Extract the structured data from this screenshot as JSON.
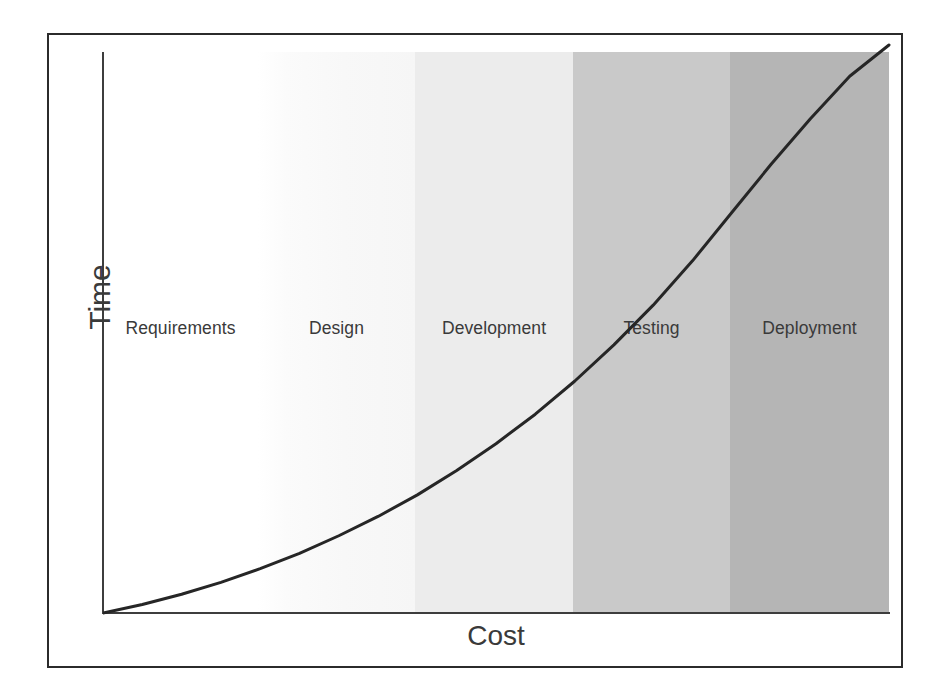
{
  "chart_data": {
    "type": "area",
    "title": "",
    "subtitle": "",
    "xlabel": "Cost",
    "ylabel": "Time",
    "grid": false,
    "legend": "none",
    "xlim": [
      0,
      5
    ],
    "ylim": [
      0,
      1
    ],
    "axis_ticks": {
      "x": [],
      "y": []
    },
    "categories": [
      "Requirements",
      "Design",
      "Development",
      "Testing",
      "Deployment"
    ],
    "bands": [
      {
        "label": "Requirements",
        "x_start": 0,
        "x_end": 1,
        "fill": "#ffffff"
      },
      {
        "label": "Design",
        "x_start": 1,
        "x_end": 2,
        "fill": "#fafafa"
      },
      {
        "label": "Development",
        "x_start": 2,
        "x_end": 3,
        "fill": "#ececec"
      },
      {
        "label": "Testing",
        "x_start": 3,
        "x_end": 4,
        "fill": "#c9c9c9"
      },
      {
        "label": "Deployment",
        "x_start": 4,
        "x_end": 5,
        "fill": "#b5b5b5"
      }
    ],
    "series": [
      {
        "name": "Cost of change over time",
        "shape": "exponential",
        "color": "#262626",
        "points": [
          {
            "x": 0.0,
            "y": 0.0
          },
          {
            "x": 0.25,
            "y": 0.015
          },
          {
            "x": 0.5,
            "y": 0.033
          },
          {
            "x": 0.75,
            "y": 0.054
          },
          {
            "x": 1.0,
            "y": 0.078
          },
          {
            "x": 1.25,
            "y": 0.105
          },
          {
            "x": 1.5,
            "y": 0.136
          },
          {
            "x": 1.75,
            "y": 0.17
          },
          {
            "x": 2.0,
            "y": 0.208
          },
          {
            "x": 2.25,
            "y": 0.251
          },
          {
            "x": 2.5,
            "y": 0.298
          },
          {
            "x": 2.75,
            "y": 0.35
          },
          {
            "x": 3.0,
            "y": 0.408
          },
          {
            "x": 3.25,
            "y": 0.472
          },
          {
            "x": 3.5,
            "y": 0.542
          },
          {
            "x": 3.75,
            "y": 0.62
          },
          {
            "x": 4.0,
            "y": 0.705
          },
          {
            "x": 4.25,
            "y": 0.79
          },
          {
            "x": 4.5,
            "y": 0.87
          },
          {
            "x": 4.75,
            "y": 0.945
          },
          {
            "x": 5.0,
            "y": 1.0
          }
        ]
      }
    ]
  },
  "axes": {
    "y_title": "Time",
    "x_title": "Cost"
  },
  "bands": {
    "requirements": {
      "label": "Requirements",
      "fill": "#ffffff"
    },
    "design": {
      "label": "Design",
      "fill": "#fafafa"
    },
    "development": {
      "label": "Development",
      "fill": "#ececec"
    },
    "testing": {
      "label": "Testing",
      "fill": "#c9c9c9"
    },
    "deployment": {
      "label": "Deployment",
      "fill": "#b5b5b5"
    }
  },
  "style": {
    "frame_color": "#2b2b2b",
    "axis_color": "#3d3d3d",
    "curve_color": "#262626",
    "label_color": "#3a3a3a",
    "background": "#ffffff"
  }
}
